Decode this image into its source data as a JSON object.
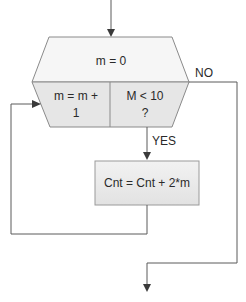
{
  "diagram": {
    "type": "flowchart",
    "nodes": {
      "loop_init": {
        "label": "m = 0"
      },
      "loop_increment": {
        "line1": "m = m +",
        "line2": "1"
      },
      "loop_condition": {
        "line1": "M < 10",
        "line2": "?"
      },
      "process": {
        "label": "Cnt = Cnt + 2*m"
      }
    },
    "edges": {
      "yes_label": "YES",
      "no_label": "NO"
    },
    "colors": {
      "init_fill": "#f6f6f6",
      "lower_fill": "#e6e6e6",
      "process_fill": "#ececec",
      "stroke": "#8a8a8a",
      "line": "#5a5a5a"
    }
  }
}
